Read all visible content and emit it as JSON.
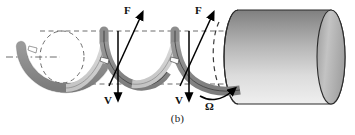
{
  "figure": {
    "caption": "(b)",
    "labels": {
      "force_1": "F",
      "force_2": "F",
      "velocity_1": "V",
      "velocity_2": "V",
      "angular_velocity": "Ω"
    },
    "colors": {
      "background": "#ffffff",
      "ribbon_outer": "#8e8e8e",
      "ribbon_inner": "#d2d2d2",
      "ribbon_stroke": "#3a3a3a",
      "cylinder_top": "#8a8a8a",
      "cylinder_bottom": "#ececec",
      "cylinder_stroke": "#2b2b2b",
      "endcap_light": "#bdbdbd",
      "endcap_dark": "#9a9a9a",
      "dashed_line": "#707070",
      "arrow": "#000000",
      "text": "#111111"
    },
    "elements": {
      "helix_name": "helical ribbon coil",
      "cylinder_name": "rotating cylinder drum",
      "axis_line_name": "center axis dash-dot line",
      "guide_top_name": "upper dashed guide line",
      "guide_bottom_name": "lower dashed guide line",
      "hidden_circle_name": "dashed hidden coil ellipse",
      "hidden_arc_name": "dashed hidden cylinder edge"
    },
    "geometry": {
      "axis_y": 57,
      "guide_top_y": 31,
      "guide_bottom_y": 84,
      "cylinder_left_x": 238,
      "cylinder_right_x": 345,
      "cylinder_top_y": 10,
      "cylinder_bottom_y": 104,
      "endcap_rx": 14,
      "endcap_ry": 47
    }
  }
}
